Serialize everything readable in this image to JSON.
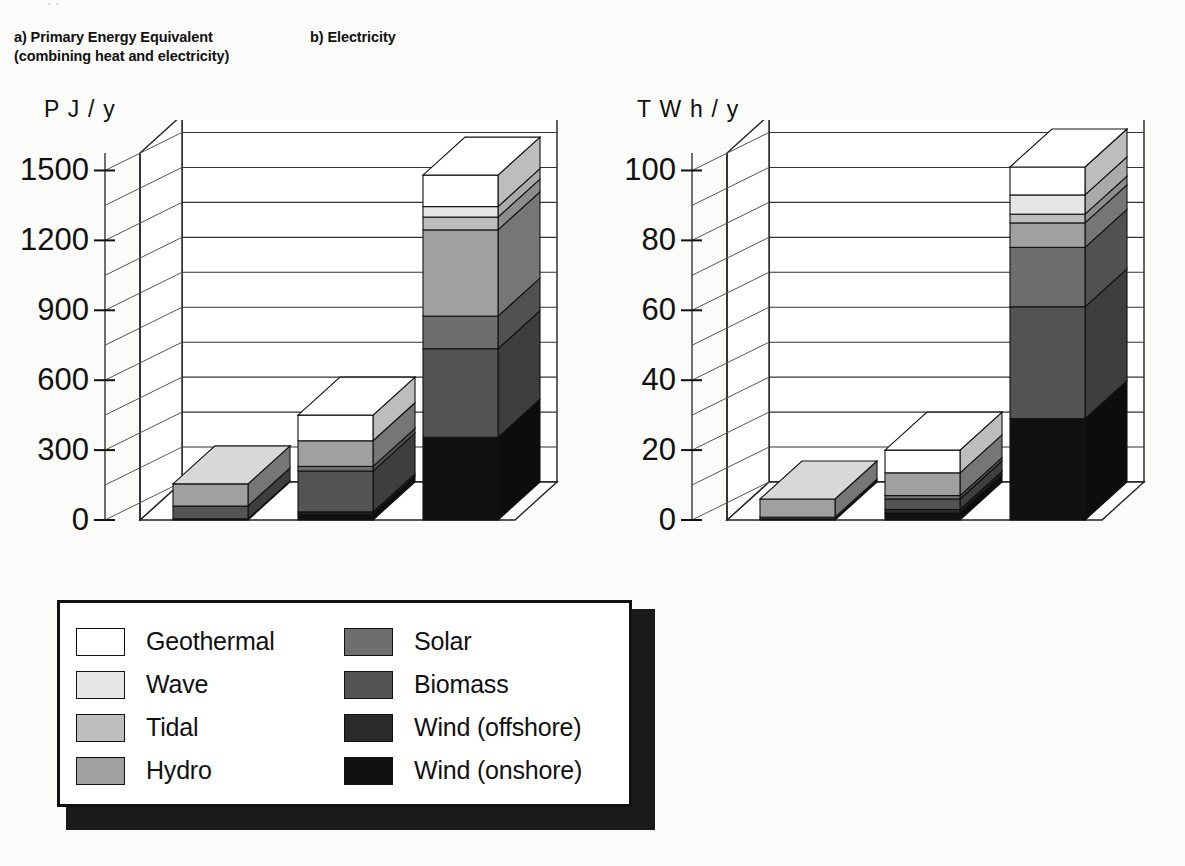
{
  "page": {
    "cropped_top_text": "renewable energy"
  },
  "panels": [
    {
      "id": "a",
      "title": "a) Primary Energy Equivalent\n(combining heat and electricity)",
      "unit": "P J / y"
    },
    {
      "id": "b",
      "title": "b) Electricity",
      "unit": "T W h / y"
    }
  ],
  "legend": {
    "left_items": [
      {
        "label": "Geothermal",
        "color": "#ffffff"
      },
      {
        "label": "Wave",
        "color": "#e6e6e6"
      },
      {
        "label": "Tidal",
        "color": "#bdbdbd"
      },
      {
        "label": "Hydro",
        "color": "#a0a0a0"
      }
    ],
    "right_items": [
      {
        "label": "Solar",
        "color": "#6e6e6e"
      },
      {
        "label": "Biomass",
        "color": "#545454"
      },
      {
        "label": "Wind (offshore)",
        "color": "#2a2a2a"
      },
      {
        "label": "Wind (onshore)",
        "color": "#111111"
      }
    ]
  },
  "chart_data": [
    {
      "type": "bar",
      "stacked": true,
      "title": "a) Primary Energy Equivalent (combining heat and electricity)",
      "xlabel": "",
      "ylabel": "P J / y",
      "ylim": [
        0,
        1575
      ],
      "yticks": [
        0,
        300,
        600,
        900,
        1200,
        1500
      ],
      "ytick_labels": [
        "0",
        "300",
        "600",
        "900",
        "1200",
        "1500"
      ],
      "minor_gridline_step": 150,
      "grid": true,
      "legend_position": "below",
      "categories": [
        "1990",
        "2005",
        "2020"
      ],
      "series": [
        {
          "name": "Wind (onshore)",
          "color": "#111111",
          "values": [
            5,
            25,
            355
          ]
        },
        {
          "name": "Wind (offshore)",
          "color": "#2a2a2a",
          "values": [
            0,
            10,
            0
          ]
        },
        {
          "name": "Biomass",
          "color": "#545454",
          "values": [
            55,
            175,
            380
          ]
        },
        {
          "name": "Solar",
          "color": "#6e6e6e",
          "values": [
            0,
            20,
            140
          ]
        },
        {
          "name": "Hydro",
          "color": "#a0a0a0",
          "values": [
            95,
            110,
            370
          ]
        },
        {
          "name": "Tidal",
          "color": "#bdbdbd",
          "values": [
            0,
            0,
            55
          ]
        },
        {
          "name": "Wave",
          "color": "#e6e6e6",
          "values": [
            0,
            0,
            45
          ]
        },
        {
          "name": "Geothermal",
          "color": "#ffffff",
          "values": [
            0,
            110,
            135
          ]
        }
      ],
      "totals": [
        155,
        450,
        1480
      ]
    },
    {
      "type": "bar",
      "stacked": true,
      "title": "b) Electricity",
      "xlabel": "",
      "ylabel": "T W h / y",
      "ylim": [
        0,
        105
      ],
      "yticks": [
        0,
        20,
        40,
        60,
        80,
        100
      ],
      "ytick_labels": [
        "0",
        "20",
        "40",
        "60",
        "80",
        "100"
      ],
      "minor_gridline_step": 10,
      "grid": true,
      "legend_position": "below",
      "categories": [
        "1990",
        "2005",
        "2020"
      ],
      "series": [
        {
          "name": "Wind (onshore)",
          "color": "#111111",
          "values": [
            0.3,
            2.0,
            29.0
          ]
        },
        {
          "name": "Wind (offshore)",
          "color": "#2a2a2a",
          "values": [
            0,
            1.0,
            0
          ]
        },
        {
          "name": "Biomass",
          "color": "#545454",
          "values": [
            0.5,
            3.0,
            32.0
          ]
        },
        {
          "name": "Solar",
          "color": "#6e6e6e",
          "values": [
            0,
            1.0,
            17.0
          ]
        },
        {
          "name": "Hydro",
          "color": "#a0a0a0",
          "values": [
            5.2,
            6.5,
            7.0
          ]
        },
        {
          "name": "Tidal",
          "color": "#bdbdbd",
          "values": [
            0,
            0,
            2.5
          ]
        },
        {
          "name": "Wave",
          "color": "#e6e6e6",
          "values": [
            0,
            0,
            5.5
          ]
        },
        {
          "name": "Geothermal",
          "color": "#ffffff",
          "values": [
            0,
            6.5,
            8.0
          ]
        }
      ],
      "totals": [
        6.0,
        20.0,
        101.0
      ]
    }
  ]
}
